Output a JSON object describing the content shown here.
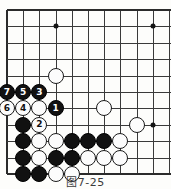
{
  "figure": {
    "caption": "图7-25",
    "type": "go-board-diagram"
  },
  "board": {
    "columns": 11,
    "rows": 10,
    "origin_x": 7,
    "origin_y": 10,
    "spacing_x": 16.2,
    "spacing_y": 16.4,
    "line_color": "#3a3a3a",
    "edge_color": "#2b2b2b",
    "background": "#fdfdfb",
    "edges": {
      "left": true,
      "top": true,
      "bottom": true,
      "right": false
    },
    "hoshi": [
      {
        "col": 3,
        "row": 1
      },
      {
        "col": 9,
        "row": 1
      },
      {
        "col": 9,
        "row": 7
      }
    ]
  },
  "stones": [
    {
      "col": 3,
      "row": 4,
      "color": "white",
      "label": ""
    },
    {
      "col": 0,
      "row": 5,
      "color": "black",
      "label": "7"
    },
    {
      "col": 1,
      "row": 5,
      "color": "black",
      "label": "5"
    },
    {
      "col": 2,
      "row": 5,
      "color": "black",
      "label": "3"
    },
    {
      "col": 0,
      "row": 6,
      "color": "white",
      "label": "6"
    },
    {
      "col": 1,
      "row": 6,
      "color": "white",
      "label": "4"
    },
    {
      "col": 2,
      "row": 6,
      "color": "white",
      "label": ""
    },
    {
      "col": 3,
      "row": 6,
      "color": "black",
      "label": "1"
    },
    {
      "col": 6,
      "row": 6,
      "color": "white",
      "label": ""
    },
    {
      "col": 1,
      "row": 7,
      "color": "black",
      "label": ""
    },
    {
      "col": 2,
      "row": 7,
      "color": "white",
      "label": "2"
    },
    {
      "col": 8,
      "row": 7,
      "color": "white",
      "label": ""
    },
    {
      "col": 1,
      "row": 8,
      "color": "black",
      "label": ""
    },
    {
      "col": 2,
      "row": 8,
      "color": "white",
      "label": ""
    },
    {
      "col": 3,
      "row": 8,
      "color": "white",
      "label": ""
    },
    {
      "col": 4,
      "row": 8,
      "color": "black",
      "label": ""
    },
    {
      "col": 5,
      "row": 8,
      "color": "black",
      "label": ""
    },
    {
      "col": 6,
      "row": 8,
      "color": "black",
      "label": ""
    },
    {
      "col": 7,
      "row": 8,
      "color": "white",
      "label": ""
    },
    {
      "col": 1,
      "row": 9,
      "color": "black",
      "label": ""
    },
    {
      "col": 2,
      "row": 9,
      "color": "white",
      "label": ""
    },
    {
      "col": 3,
      "row": 9,
      "color": "black",
      "label": ""
    },
    {
      "col": 4,
      "row": 9,
      "color": "black",
      "label": ""
    },
    {
      "col": 5,
      "row": 9,
      "color": "white",
      "label": ""
    },
    {
      "col": 6,
      "row": 9,
      "color": "white",
      "label": ""
    },
    {
      "col": 7,
      "row": 9,
      "color": "white",
      "label": ""
    },
    {
      "col": 1,
      "row": 10,
      "color": "black",
      "label": ""
    },
    {
      "col": 2,
      "row": 10,
      "color": "black",
      "label": ""
    },
    {
      "col": 3,
      "row": 10,
      "color": "white",
      "label": ""
    },
    {
      "col": 4,
      "row": 10,
      "color": "white",
      "label": ""
    }
  ]
}
